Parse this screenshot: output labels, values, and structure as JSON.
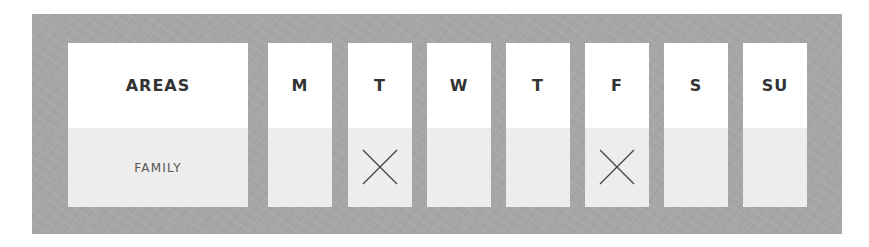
{
  "header": {
    "areas_label": "AREAS"
  },
  "days": [
    {
      "label": "M",
      "checked": false
    },
    {
      "label": "T",
      "checked": true
    },
    {
      "label": "W",
      "checked": false
    },
    {
      "label": "T",
      "checked": false
    },
    {
      "label": "F",
      "checked": true
    },
    {
      "label": "S",
      "checked": false
    },
    {
      "label": "SU",
      "checked": false
    }
  ],
  "rows": [
    {
      "area": "FAMILY"
    }
  ],
  "colors": {
    "frame": "#a6a6a6",
    "cell_top": "#ffffff",
    "cell_bottom": "#ededed",
    "text": "#333333"
  }
}
